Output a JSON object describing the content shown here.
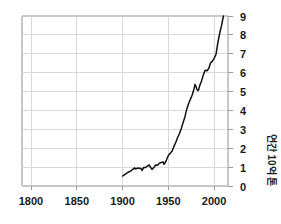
{
  "chart_data": {
    "type": "line",
    "title": "",
    "subtitle": "",
    "xlabel": "",
    "ylabel": "연간 10억 톤",
    "xlim": [
      1790,
      2015
    ],
    "ylim": [
      0,
      9
    ],
    "grid": true,
    "legend": null,
    "legend_position": "none",
    "xticks": [
      1800,
      1850,
      1900,
      1950,
      2000
    ],
    "xtick_labels": [
      "1800",
      "1850",
      "1900",
      "1950",
      "2000"
    ],
    "yticks": [
      0,
      1,
      2,
      3,
      4,
      5,
      6,
      7,
      8,
      9
    ],
    "ytick_labels": [
      "0",
      "1",
      "2",
      "3",
      "4",
      "5",
      "6",
      "7",
      "8",
      "9"
    ],
    "ytick_side": "right",
    "series": [
      {
        "name": "연간 배출량",
        "color": "#111111",
        "x": [
          1900,
          1903,
          1906,
          1909,
          1911,
          1913,
          1914,
          1916,
          1918,
          1920,
          1921,
          1923,
          1925,
          1927,
          1929,
          1930,
          1932,
          1934,
          1936,
          1938,
          1940,
          1942,
          1944,
          1945,
          1946,
          1948,
          1950,
          1952,
          1954,
          1956,
          1958,
          1960,
          1962,
          1964,
          1966,
          1968,
          1970,
          1972,
          1974,
          1976,
          1978,
          1979,
          1980,
          1981,
          1982,
          1983,
          1984,
          1986,
          1988,
          1990,
          1992,
          1994,
          1996,
          1998,
          2000,
          2002,
          2004,
          2006,
          2008,
          2010
        ],
        "values": [
          0.53,
          0.63,
          0.73,
          0.8,
          0.88,
          0.96,
          0.9,
          0.95,
          0.94,
          0.93,
          0.82,
          0.98,
          0.98,
          1.06,
          1.11,
          1.02,
          0.88,
          0.98,
          1.11,
          1.1,
          1.21,
          1.24,
          1.28,
          1.15,
          1.2,
          1.4,
          1.63,
          1.74,
          1.85,
          2.1,
          2.32,
          2.57,
          2.78,
          3.05,
          3.36,
          3.67,
          4.08,
          4.37,
          4.6,
          4.83,
          5.16,
          5.38,
          5.27,
          5.13,
          5.05,
          5.1,
          5.3,
          5.55,
          5.87,
          6.13,
          6.1,
          6.22,
          6.52,
          6.61,
          6.77,
          6.99,
          7.6,
          8.1,
          8.5,
          9.0
        ]
      }
    ]
  },
  "axis": {
    "y_label_full": "연간 10억 톤",
    "y_label_rotation": "90"
  }
}
